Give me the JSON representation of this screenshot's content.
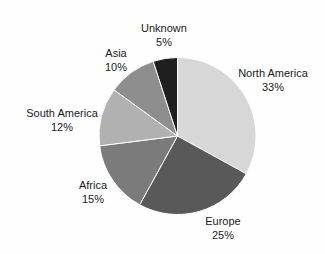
{
  "page": {
    "background_color": "#fefefe",
    "text_color": "#1a1a1a"
  },
  "chart_data": {
    "type": "pie",
    "title": "",
    "legend": "none",
    "labels_position": "outside",
    "start_angle_deg": 0,
    "direction": "clockwise",
    "separator_color": "#ffffff",
    "categories": [
      "North America",
      "Europe",
      "Africa",
      "South America",
      "Asia",
      "Unknown"
    ],
    "values": [
      33,
      25,
      15,
      12,
      10,
      5
    ],
    "slices": [
      {
        "label": "North America",
        "value": 33,
        "pct_label": "33%",
        "color": "#d7d7d7"
      },
      {
        "label": "Europe",
        "value": 25,
        "pct_label": "25%",
        "color": "#595959"
      },
      {
        "label": "Africa",
        "value": 15,
        "pct_label": "15%",
        "color": "#7b7b7b"
      },
      {
        "label": "South America",
        "value": 12,
        "pct_label": "12%",
        "color": "#b1b1b1"
      },
      {
        "label": "Asia",
        "value": 10,
        "pct_label": "10%",
        "color": "#8e8e8e"
      },
      {
        "label": "Unknown",
        "value": 5,
        "pct_label": "5%",
        "color": "#1f1f1f"
      }
    ]
  }
}
